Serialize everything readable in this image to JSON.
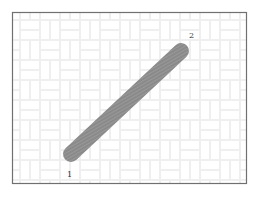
{
  "diagram": {
    "frame": {
      "x": 12,
      "y": 12,
      "width": 235,
      "height": 172,
      "stroke": "#6e6e6e",
      "background": "#ffffff"
    },
    "background_pattern": {
      "type": "basketweave",
      "color": "#f1f1f1"
    },
    "segment": {
      "fill": "#8c8c8c",
      "hatch": "#a8a8a8",
      "width": 16,
      "start": {
        "x": 71,
        "y": 154,
        "label": "1"
      },
      "end": {
        "x": 181,
        "y": 51,
        "label": "2"
      }
    },
    "labels": [
      {
        "id": "point-1",
        "text": "1",
        "x": 67,
        "y": 176
      },
      {
        "id": "point-2",
        "text": "2",
        "x": 189,
        "y": 38
      }
    ]
  }
}
